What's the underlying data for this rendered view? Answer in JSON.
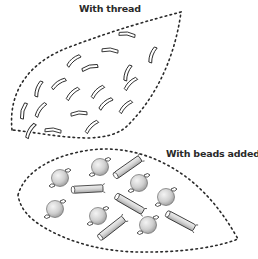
{
  "labels": {
    "top": "With thread",
    "bottom": "With beads added"
  },
  "colors": {
    "ink": "#2a2a2a",
    "bead_fill_light": "#f2f2f2",
    "bead_fill_dark": "#a9a9a9",
    "background": "#ffffff"
  },
  "panels": [
    {
      "name": "with-thread",
      "label": "With thread",
      "element_type": "thread-stitch",
      "count": 19
    },
    {
      "name": "with-beads-added",
      "label": "With beads added",
      "element_types": [
        "round-bead",
        "tube-bead"
      ],
      "round_bead_count": 7,
      "tube_bead_count": 5
    }
  ]
}
